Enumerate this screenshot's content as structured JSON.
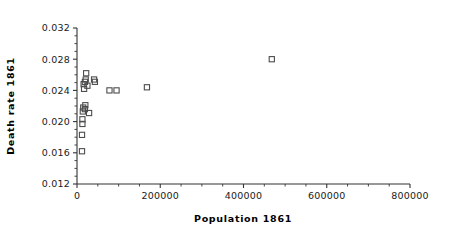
{
  "chart_data": {
    "type": "scatter",
    "title": "",
    "xlabel": "Population 1861",
    "ylabel": "Death rate 1861",
    "xlim": [
      0,
      800000
    ],
    "ylim": [
      0.012,
      0.032
    ],
    "grid": false,
    "legend": null,
    "x_major_ticks": [
      0,
      200000,
      400000,
      600000,
      800000
    ],
    "x_tick_labels": [
      "0",
      "200000",
      "400000",
      "600000",
      "800000"
    ],
    "x_minor_interval": 50000,
    "y_major_ticks": [
      0.012,
      0.016,
      0.02,
      0.024,
      0.028,
      0.032
    ],
    "y_tick_labels": [
      "0.012",
      "0.016",
      "0.020",
      "0.024",
      "0.028",
      "0.032"
    ],
    "y_minor_interval": 0.001,
    "marker": "open-square",
    "marker_color": "#4d4d4d",
    "points": [
      {
        "x": 12000,
        "y": 0.0162
      },
      {
        "x": 12000,
        "y": 0.0183
      },
      {
        "x": 13000,
        "y": 0.0197
      },
      {
        "x": 13000,
        "y": 0.0203
      },
      {
        "x": 14000,
        "y": 0.0213
      },
      {
        "x": 15000,
        "y": 0.0218
      },
      {
        "x": 19000,
        "y": 0.0216
      },
      {
        "x": 20000,
        "y": 0.0221
      },
      {
        "x": 29000,
        "y": 0.0211
      },
      {
        "x": 17000,
        "y": 0.0242
      },
      {
        "x": 16000,
        "y": 0.0248
      },
      {
        "x": 19000,
        "y": 0.0251
      },
      {
        "x": 21000,
        "y": 0.0254
      },
      {
        "x": 22000,
        "y": 0.0262
      },
      {
        "x": 25000,
        "y": 0.0246
      },
      {
        "x": 41000,
        "y": 0.0254
      },
      {
        "x": 43000,
        "y": 0.0251
      },
      {
        "x": 78000,
        "y": 0.024
      },
      {
        "x": 95000,
        "y": 0.024
      },
      {
        "x": 168000,
        "y": 0.0244
      },
      {
        "x": 468000,
        "y": 0.028
      }
    ]
  }
}
